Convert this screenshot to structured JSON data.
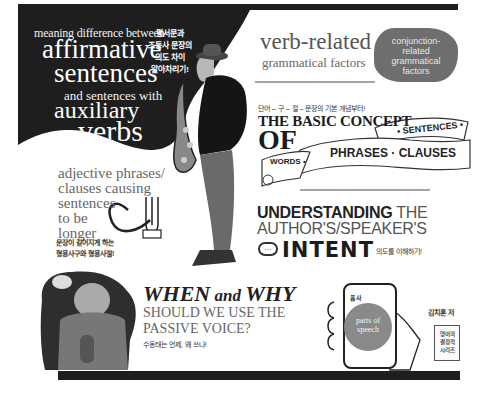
{
  "colors": {
    "dark": "#1e1e1e",
    "mid_gray": "#6e6e6e",
    "light_text": "#ffffff",
    "body_text": "#555555"
  },
  "panel_affirmative": {
    "line1": "meaning difference between",
    "line2": "affirmative",
    "line3": "sentences",
    "line4": "and sentences with",
    "line5": "auxiliary",
    "line6": "verbs",
    "korean": [
      "평서문과",
      "조동사 문장의",
      "의도 차이",
      "알아차리기!"
    ]
  },
  "panel_verb": {
    "title": "verb-related",
    "subtitle": "grammatical factors",
    "conjunction": [
      "conjunction-",
      "related",
      "grammatical",
      "factors"
    ]
  },
  "panel_basic": {
    "korean": "단어 – 구 – 절 – 문장의 기본 개념부터!",
    "title": "THE BASIC CONCEPT",
    "of": "OF",
    "banner_sentences": "• SENTENCES •",
    "banner_phrases": "PHRASES · CLAUSES",
    "banner_words": "WORDS •"
  },
  "panel_intent": {
    "bold": "UNDERSTANDING",
    "light": " THE",
    "line2": "AUTHOR'S/SPEAKER'S",
    "intent": "INTENT",
    "icon_text": "···",
    "korean": "의도를 이해하기!"
  },
  "panel_adjective": {
    "lines": [
      "adjective phrases/",
      "clauses causing",
      "sentences",
      "to be",
      "longer"
    ],
    "korean": [
      "문장이 길어지게 하는",
      "형용사구와 형용사절!"
    ]
  },
  "panel_passive": {
    "when": "WHEN",
    "and": " and ",
    "why": "WHY",
    "line2": "SHOULD WE USE THE",
    "line3": "PASSIVE VOICE?",
    "korean": "수동태는 언제, 왜 쓰나!"
  },
  "panel_phone": {
    "label": "품사",
    "circle": [
      "parts of",
      "speech"
    ]
  },
  "author": {
    "name": "김치훈 저",
    "book": [
      "영어의",
      "결정적",
      "시리즈"
    ]
  }
}
